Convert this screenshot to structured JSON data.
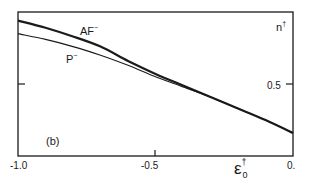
{
  "chart_data": {
    "type": "line",
    "title": "",
    "panel_label": "(b)",
    "xlabel": "ε0†",
    "ylabel": "n†",
    "xlim": [
      -1.0,
      0.0
    ],
    "ylim": [
      0.0,
      1.0
    ],
    "grid": false,
    "legend": "inline labels",
    "x_ticks": [
      "-1.0",
      "-0.5",
      "0."
    ],
    "y_ticks": [
      "0.5"
    ],
    "x": [
      -1.0,
      -0.9,
      -0.8,
      -0.7,
      -0.6,
      -0.5,
      -0.4,
      -0.3,
      -0.2,
      -0.1,
      0.0
    ],
    "series": [
      {
        "name": "AF⁻",
        "line": "thick",
        "values": [
          0.94,
          0.89,
          0.83,
          0.76,
          0.66,
          0.57,
          0.49,
          0.41,
          0.33,
          0.25,
          0.16
        ]
      },
      {
        "name": "P⁻",
        "line": "thin",
        "values": [
          0.85,
          0.81,
          0.76,
          0.7,
          0.63,
          0.55,
          0.48,
          0.41,
          0.33,
          0.25,
          0.16
        ]
      }
    ]
  },
  "labels": {
    "panel": "(b)",
    "series_af": "AF",
    "series_af_sup": "−",
    "series_p": "P",
    "series_p_sup": "−",
    "ylabel_main": "n",
    "ylabel_sup": "†",
    "xlabel_main": "ε",
    "xlabel_sup": "†",
    "xlabel_sub": "0",
    "xtick_0": "-1.0",
    "xtick_1": "-0.5",
    "xtick_2": "0.",
    "ytick_0": "0.5"
  },
  "colors": {
    "ink": "#1a1a1a",
    "background": "#ffffff"
  }
}
